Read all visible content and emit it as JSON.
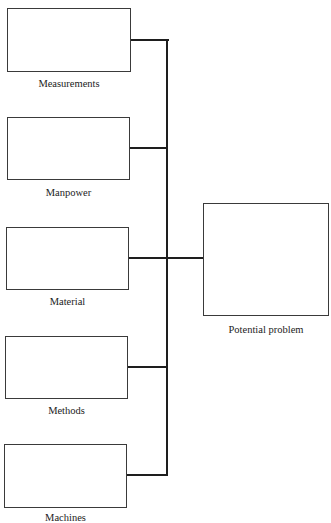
{
  "diagram": {
    "type": "cause-and-effect",
    "causes": [
      {
        "label": "Measurements"
      },
      {
        "label": "Manpower"
      },
      {
        "label": "Material"
      },
      {
        "label": "Methods"
      },
      {
        "label": "Machines"
      }
    ],
    "effect": {
      "label": "Potential problem"
    }
  }
}
